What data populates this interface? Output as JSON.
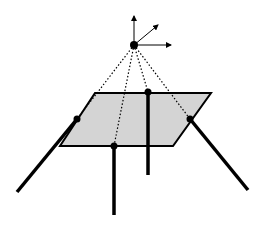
{
  "diagram": {
    "colors": {
      "background": "#ffffff",
      "plane_fill": "#d4d4d4",
      "line": "#000000"
    },
    "camera_center": {
      "x": 134,
      "y": 45,
      "r": 4
    },
    "axes": [
      {
        "name": "up",
        "x1": 134,
        "y1": 45,
        "x2": 134,
        "y2": 16
      },
      {
        "name": "diagonal",
        "x1": 134,
        "y1": 45,
        "x2": 158,
        "y2": 25
      },
      {
        "name": "right",
        "x1": 134,
        "y1": 45,
        "x2": 171,
        "y2": 45
      }
    ],
    "plane": {
      "points": "95,93 211,93 173,146 60,146"
    },
    "points": [
      {
        "name": "left",
        "x": 77,
        "y": 119
      },
      {
        "name": "top-middle",
        "x": 148,
        "y": 92
      },
      {
        "name": "right",
        "x": 190,
        "y": 119
      },
      {
        "name": "bottom-middle",
        "x": 114,
        "y": 146
      }
    ],
    "rays": [
      {
        "x2": 77,
        "y2": 119
      },
      {
        "x2": 148,
        "y2": 92
      },
      {
        "x2": 190,
        "y2": 119
      },
      {
        "x2": 114,
        "y2": 146
      }
    ],
    "legs": [
      {
        "name": "left-leg",
        "x1": 77,
        "y1": 119,
        "x2": 17,
        "y2": 192
      },
      {
        "name": "center-leg",
        "x1": 148,
        "y1": 92,
        "x2": 148,
        "y2": 175
      },
      {
        "name": "right-leg",
        "x1": 190,
        "y1": 119,
        "x2": 248,
        "y2": 190
      },
      {
        "name": "bottom-leg",
        "x1": 114,
        "y1": 146,
        "x2": 114,
        "y2": 215
      }
    ]
  }
}
